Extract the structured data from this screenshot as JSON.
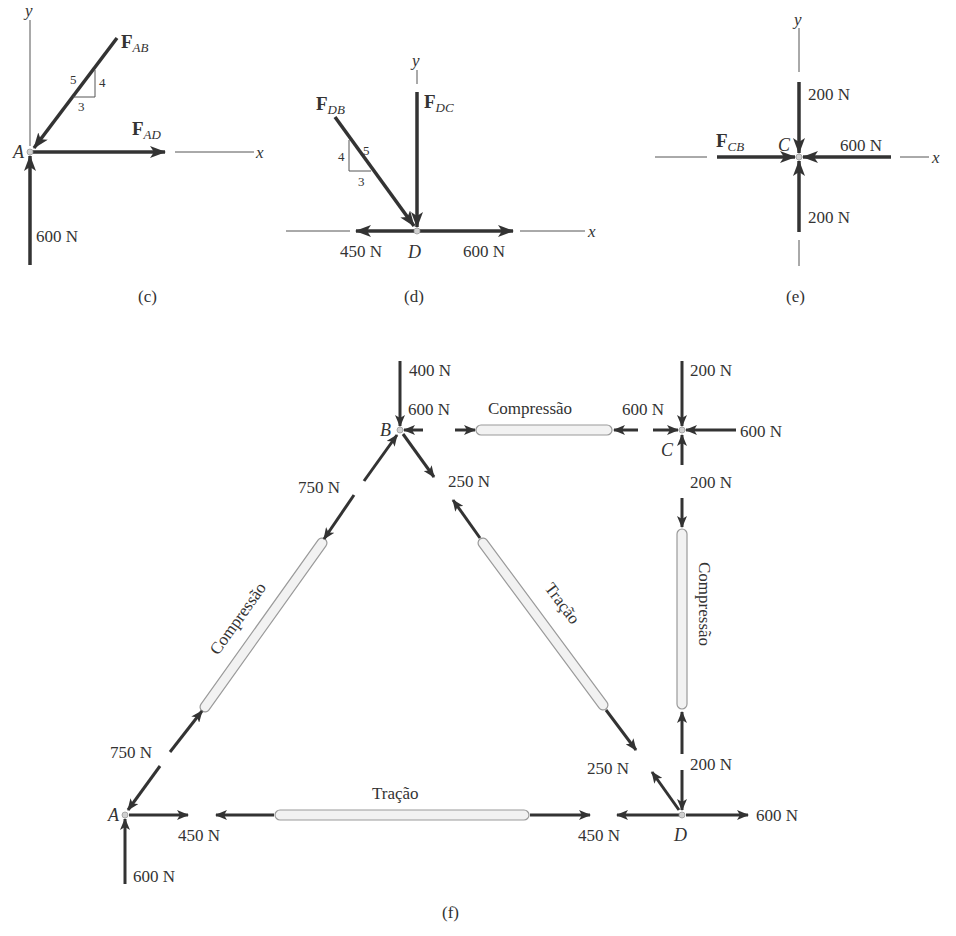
{
  "colors": {
    "arrow": "#333333",
    "axis": "#555555",
    "text": "#333333",
    "member_fill": "#f2f2f2",
    "member_stroke": "#9a9a9a",
    "joint": "#d0d0d0"
  },
  "panel_c": {
    "caption": "(c)",
    "joint": "A",
    "axis_x": "x",
    "axis_y": "y",
    "force_ab": {
      "symbol": "F",
      "sub": "AB"
    },
    "force_ad": {
      "symbol": "F",
      "sub": "AD"
    },
    "slope": {
      "hyp": "5",
      "rise": "4",
      "run": "3"
    },
    "reaction_label": "600 N"
  },
  "panel_d": {
    "caption": "(d)",
    "joint": "D",
    "axis_x": "x",
    "axis_y": "y",
    "force_db": {
      "symbol": "F",
      "sub": "DB"
    },
    "force_dc": {
      "symbol": "F",
      "sub": "DC"
    },
    "slope": {
      "hyp": "5",
      "rise": "4",
      "run": "3"
    },
    "left_force": "450 N",
    "right_force": "600 N"
  },
  "panel_e": {
    "caption": "(e)",
    "joint": "C",
    "axis_x": "x",
    "axis_y": "y",
    "force_cb": {
      "symbol": "F",
      "sub": "CB"
    },
    "top_force": "200 N",
    "bottom_force": "200 N",
    "right_force": "600 N"
  },
  "panel_f": {
    "caption": "(f)",
    "joints": {
      "A": "A",
      "B": "B",
      "C": "C",
      "D": "D"
    },
    "loads": {
      "B_top": "400 N",
      "C_top": "200 N",
      "C_right": "600 N",
      "A_bottom": "600 N",
      "D_right": "600 N"
    },
    "members": {
      "BC": {
        "state": "Compressão",
        "force_B": "600 N",
        "force_C": "600 N"
      },
      "AB": {
        "state": "Compressão",
        "force_B": "750 N",
        "force_A": "750 N"
      },
      "BD": {
        "state": "Tração",
        "force_B": "250 N",
        "force_D": "250 N"
      },
      "CD": {
        "state": "Compressão",
        "force_C": "200 N",
        "force_D": "200 N"
      },
      "AD": {
        "state": "Tração",
        "force_A": "450 N",
        "force_D": "450 N"
      }
    }
  }
}
